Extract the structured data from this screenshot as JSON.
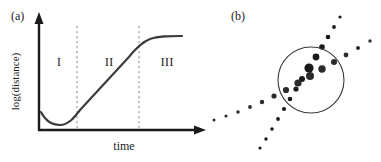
{
  "figure": {
    "width": 381,
    "height": 162,
    "background": "#ffffff",
    "ink_color": "#1a1a1a"
  },
  "panel_a": {
    "label": "(a)",
    "axes": {
      "x_title": "time",
      "y_title": "log(distance)",
      "x_axis_arrow": true,
      "y_axis_arrow": true,
      "tick_labels_x": [],
      "tick_labels_y": []
    },
    "regions": [
      {
        "name": "region-1",
        "label": "I"
      },
      {
        "name": "region-2",
        "label": "II"
      },
      {
        "name": "region-3",
        "label": "III"
      }
    ],
    "dividers": [
      {
        "name": "divider-1",
        "x_px": 77,
        "style": "dashed"
      },
      {
        "name": "divider-2",
        "x_px": 139,
        "style": "dashed"
      }
    ],
    "curve": {
      "name": "log-distance-curve",
      "description": "sigmoid-like trace: shallow dip, linear rise, plateau",
      "color": "#3a3a3a",
      "stroke_width": 2
    },
    "chart_data": {
      "type": "line",
      "title": "",
      "xlabel": "time",
      "ylabel": "log(distance)",
      "xlim": [
        0,
        100
      ],
      "ylim": [
        0,
        100
      ],
      "grid": false,
      "legend": null,
      "x": [
        0,
        5,
        10,
        15,
        20,
        25,
        30,
        35,
        40,
        45,
        50,
        55,
        60,
        65,
        70,
        75,
        80,
        85,
        90,
        95,
        100
      ],
      "y": [
        18,
        13,
        10,
        9,
        10,
        14,
        20,
        27,
        34,
        42,
        50,
        58,
        66,
        73,
        79,
        84,
        87,
        88,
        89,
        89,
        89
      ],
      "annotations": [
        {
          "label": "I",
          "x": 14
        },
        {
          "label": "II",
          "x": 45
        },
        {
          "label": "III",
          "x": 82
        }
      ],
      "vlines": [
        27,
        65
      ]
    }
  },
  "panel_b": {
    "label": "(b)",
    "circle": {
      "name": "cluster-circle",
      "cx_px": 311,
      "cy_px": 80,
      "r_px": 33,
      "stroke": "#3a3a3a",
      "stroke_width": 1
    },
    "chart_data": {
      "type": "scatter",
      "title": "",
      "xlabel": "",
      "ylabel": "",
      "xlim": [
        0,
        171
      ],
      "ylim": [
        0,
        162
      ],
      "grid": false,
      "legend": null,
      "description": "Two dotted point-trails crossing through a circled cluster; dot size grows toward the circle centre.",
      "series": [
        {
          "name": "trail-steep",
          "color": "#1a1a1a",
          "points": [
            {
              "x": 50,
              "y": 148,
              "r": 1.6
            },
            {
              "x": 56,
              "y": 139,
              "r": 1.7
            },
            {
              "x": 62,
              "y": 129,
              "r": 1.8
            },
            {
              "x": 68,
              "y": 119,
              "r": 1.9
            },
            {
              "x": 74,
              "y": 109,
              "r": 2.1
            },
            {
              "x": 80,
              "y": 99,
              "r": 2.3
            },
            {
              "x": 86,
              "y": 89,
              "r": 2.6
            },
            {
              "x": 92,
              "y": 79,
              "r": 3.0
            },
            {
              "x": 99,
              "y": 68,
              "r": 4.6
            },
            {
              "x": 106,
              "y": 57,
              "r": 3.4
            },
            {
              "x": 112,
              "y": 47,
              "r": 2.8
            },
            {
              "x": 118,
              "y": 37,
              "r": 2.3
            },
            {
              "x": 124,
              "y": 27,
              "r": 1.9
            },
            {
              "x": 130,
              "y": 17,
              "r": 1.6
            }
          ]
        },
        {
          "name": "trail-shallow",
          "color": "#2b2b2b",
          "points": [
            {
              "x": 4,
              "y": 120,
              "r": 1.5
            },
            {
              "x": 16,
              "y": 116,
              "r": 1.6
            },
            {
              "x": 28,
              "y": 112,
              "r": 1.7
            },
            {
              "x": 40,
              "y": 107,
              "r": 1.9
            },
            {
              "x": 52,
              "y": 102,
              "r": 2.2
            },
            {
              "x": 64,
              "y": 96,
              "r": 2.6
            },
            {
              "x": 76,
              "y": 90,
              "r": 3.1
            },
            {
              "x": 88,
              "y": 83,
              "r": 3.6
            },
            {
              "x": 100,
              "y": 76,
              "r": 4.0
            },
            {
              "x": 112,
              "y": 69,
              "r": 3.7
            },
            {
              "x": 124,
              "y": 62,
              "r": 3.0
            },
            {
              "x": 136,
              "y": 55,
              "r": 2.4
            },
            {
              "x": 148,
              "y": 48,
              "r": 2.0
            },
            {
              "x": 160,
              "y": 41,
              "r": 1.7
            }
          ]
        }
      ]
    }
  }
}
